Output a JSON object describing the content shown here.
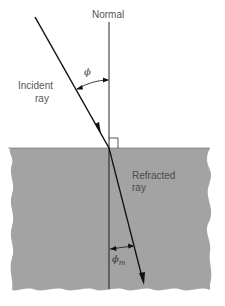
{
  "diagram": {
    "labels": {
      "normal": "Normal",
      "incident_line1": "Incident",
      "incident_line2": "ray",
      "refracted_line1": "Refracted",
      "refracted_line2": "ray",
      "phi": "ϕ",
      "phi_m_base": "ϕ",
      "phi_m_sub": "m"
    },
    "colors": {
      "medium_fill": "#a3a3a3",
      "line": "#111111",
      "text": "#555555",
      "background": "#ffffff"
    },
    "geometry": {
      "normal_x": 109,
      "surface_y": 148,
      "incident_start": [
        35,
        17
      ],
      "refracted_end": [
        143,
        283
      ]
    }
  }
}
